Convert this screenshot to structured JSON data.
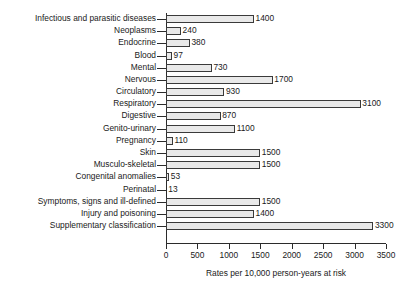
{
  "chart_data": {
    "type": "bar",
    "orientation": "horizontal",
    "title": "",
    "xlabel": "Rates per 10,000 person-years at risk",
    "ylabel": "",
    "xlim": [
      0,
      3500
    ],
    "xticks": [
      0,
      500,
      1000,
      1500,
      2000,
      2500,
      3000,
      3500
    ],
    "xtick_labels": [
      "0",
      "500",
      "1000",
      "1500",
      "2000",
      "2500",
      "3000",
      "3500"
    ],
    "grid": false,
    "legend": null,
    "bar_fill_color": "#e9e9e9",
    "bar_edge_color": "#3a3a3a",
    "categories": [
      "Infectious and parasitic diseases",
      "Neoplasms",
      "Endocrine",
      "Blood",
      "Mental",
      "Nervous",
      "Circulatory",
      "Respiratory",
      "Digestive",
      "Genito-urinary",
      "Pregnancy",
      "Skin",
      "Musculo-skeletal",
      "Congenital anomalies",
      "Perinatal",
      "Symptoms, signs and ill-defined",
      "Injury and poisoning",
      "Supplementary classification"
    ],
    "values": [
      1400,
      240,
      380,
      97,
      730,
      1700,
      930,
      3100,
      870,
      1100,
      110,
      1500,
      1500,
      53,
      13,
      1500,
      1400,
      3300
    ],
    "value_labels": [
      "1400",
      "240",
      "380",
      "97",
      "730",
      "1700",
      "930",
      "3100",
      "870",
      "1100",
      "110",
      "1500",
      "1500",
      "53",
      "13",
      "1500",
      "1400",
      "3300"
    ]
  }
}
